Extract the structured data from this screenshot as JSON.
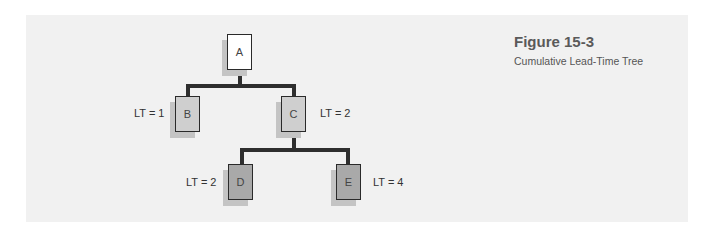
{
  "figure": {
    "title": "Figure 15-3",
    "subtitle": "Cumulative Lead-Time Tree"
  },
  "tree": {
    "nodes": [
      {
        "id": "A",
        "label": "A",
        "lead_time": null,
        "level": 0
      },
      {
        "id": "B",
        "label": "B",
        "lead_time": "LT = 1",
        "level": 1,
        "parent": "A"
      },
      {
        "id": "C",
        "label": "C",
        "lead_time": "LT = 2",
        "level": 1,
        "parent": "A"
      },
      {
        "id": "D",
        "label": "D",
        "lead_time": "LT = 2",
        "level": 2,
        "parent": "C"
      },
      {
        "id": "E",
        "label": "E",
        "lead_time": "LT = 4",
        "level": 2,
        "parent": "C"
      }
    ]
  },
  "colors": {
    "panel": "#f1f1f1",
    "root_fill": "#ffffff",
    "level1_fill": "#cfcfcf",
    "level2_fill": "#a9a9a9",
    "connector": "#2e2e2e"
  }
}
